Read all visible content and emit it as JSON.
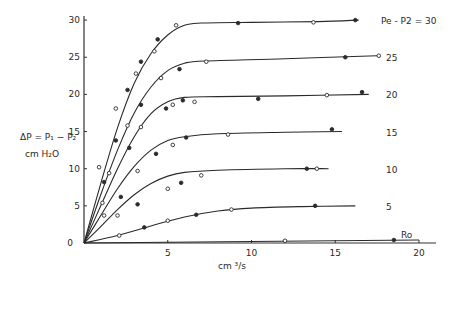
{
  "chart_data": {
    "type": "line",
    "title": "",
    "xlabel": "cm ³/s",
    "ylabel_line1": "ΔP = P₁ − P₂",
    "ylabel_line2": "cm H₂O",
    "xlim": [
      0,
      20
    ],
    "ylim": [
      0,
      30
    ],
    "x_ticks": [
      0,
      5,
      10,
      15,
      20
    ],
    "y_ticks": [
      0,
      5,
      10,
      15,
      20,
      25,
      30
    ],
    "x_tick_labels": [
      "0",
      "5",
      "10",
      "15",
      "20"
    ],
    "y_tick_labels": [
      "0",
      "5",
      "10",
      "15",
      "20",
      "25",
      "30"
    ],
    "grid": false,
    "legend": "inline labels at right end of each curve",
    "series": [
      {
        "name": "Pe - P2 = 30",
        "label": "Pe - P2 = 30",
        "curve": [
          [
            0,
            0
          ],
          [
            1,
            8
          ],
          [
            2,
            15.5
          ],
          [
            3,
            21.5
          ],
          [
            4,
            25.5
          ],
          [
            5,
            28
          ],
          [
            6,
            29.3
          ],
          [
            7,
            29.6
          ],
          [
            10,
            29.7
          ],
          [
            14,
            29.8
          ],
          [
            16.4,
            30
          ]
        ],
        "points": [
          [
            0.9,
            10.2
          ],
          [
            1.2,
            8.2
          ],
          [
            1.9,
            18.1
          ],
          [
            2.6,
            20.6
          ],
          [
            3.1,
            22.8
          ],
          [
            3.4,
            24.4
          ],
          [
            4.2,
            25.8
          ],
          [
            4.4,
            27.4
          ],
          [
            5.5,
            29.3
          ],
          [
            9.2,
            29.6
          ],
          [
            13.7,
            29.7
          ],
          [
            16.2,
            30
          ]
        ]
      },
      {
        "name": "25",
        "label": "25",
        "curve": [
          [
            0,
            0
          ],
          [
            1,
            6.5
          ],
          [
            2,
            12.5
          ],
          [
            3,
            17.5
          ],
          [
            4,
            21
          ],
          [
            5,
            23.2
          ],
          [
            6,
            24.2
          ],
          [
            7.2,
            24.5
          ],
          [
            12,
            24.8
          ],
          [
            17.5,
            25.2
          ]
        ],
        "points": [
          [
            1.1,
            5.4
          ],
          [
            1.9,
            13.8
          ],
          [
            2.6,
            15.8
          ],
          [
            3.4,
            18.6
          ],
          [
            4.6,
            22.2
          ],
          [
            5.7,
            23.4
          ],
          [
            7.3,
            24.4
          ],
          [
            15.6,
            25
          ],
          [
            17.6,
            25.2
          ]
        ]
      },
      {
        "name": "20",
        "label": "20",
        "curve": [
          [
            0,
            0
          ],
          [
            1,
            5
          ],
          [
            2,
            10
          ],
          [
            3,
            14.3
          ],
          [
            4,
            17.4
          ],
          [
            5,
            19
          ],
          [
            6,
            19.6
          ],
          [
            8,
            19.7
          ],
          [
            12,
            19.8
          ],
          [
            17,
            20
          ]
        ],
        "points": [
          [
            1.5,
            9.4
          ],
          [
            2.7,
            12.8
          ],
          [
            3.4,
            15.6
          ],
          [
            4.9,
            18.1
          ],
          [
            5.3,
            18.6
          ],
          [
            5.9,
            19.2
          ],
          [
            6.6,
            19
          ],
          [
            10.4,
            19.4
          ],
          [
            14.5,
            19.9
          ],
          [
            16.6,
            20.3
          ]
        ]
      },
      {
        "name": "15",
        "label": "15",
        "curve": [
          [
            0,
            0
          ],
          [
            1,
            3.7
          ],
          [
            2,
            7.3
          ],
          [
            3,
            10.3
          ],
          [
            4,
            12.5
          ],
          [
            5,
            13.8
          ],
          [
            6,
            14.3
          ],
          [
            8,
            14.7
          ],
          [
            12,
            14.9
          ],
          [
            15.4,
            15
          ]
        ],
        "points": [
          [
            1.2,
            3.7
          ],
          [
            2.2,
            6.2
          ],
          [
            3.2,
            9.7
          ],
          [
            4.3,
            12
          ],
          [
            5.3,
            13.2
          ],
          [
            6.1,
            14.2
          ],
          [
            8.6,
            14.6
          ],
          [
            14.8,
            15.3
          ]
        ]
      },
      {
        "name": "10",
        "label": "10",
        "curve": [
          [
            0,
            0
          ],
          [
            1,
            2.2
          ],
          [
            2,
            4.5
          ],
          [
            3,
            6.5
          ],
          [
            4,
            8
          ],
          [
            5,
            9
          ],
          [
            6,
            9.5
          ],
          [
            8,
            9.8
          ],
          [
            12,
            10
          ],
          [
            14.6,
            10
          ]
        ],
        "points": [
          [
            2,
            3.7
          ],
          [
            3.2,
            5.2
          ],
          [
            5,
            7.3
          ],
          [
            5.8,
            8.1
          ],
          [
            7,
            9.1
          ],
          [
            13.3,
            10
          ],
          [
            13.9,
            10
          ]
        ]
      },
      {
        "name": "5",
        "label": "5",
        "curve": [
          [
            0,
            0
          ],
          [
            2,
            1
          ],
          [
            4,
            2.3
          ],
          [
            6,
            3.5
          ],
          [
            8,
            4.3
          ],
          [
            10,
            4.7
          ],
          [
            13,
            4.9
          ],
          [
            16.2,
            5
          ]
        ],
        "points": [
          [
            2.1,
            1
          ],
          [
            3.6,
            2.1
          ],
          [
            5,
            3
          ],
          [
            6.7,
            3.8
          ],
          [
            8.8,
            4.5
          ],
          [
            13.8,
            5
          ]
        ]
      },
      {
        "name": "Ro",
        "label": "Ro",
        "curve": [
          [
            0,
            0
          ],
          [
            20,
            0.4
          ]
        ],
        "points": [
          [
            12,
            0.3
          ],
          [
            18.5,
            0.4
          ]
        ]
      }
    ]
  }
}
